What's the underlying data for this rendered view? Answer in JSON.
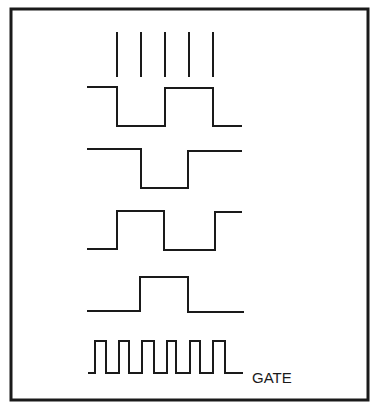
{
  "diagram": {
    "type": "timing-diagram",
    "frame": {
      "x": 11,
      "y": 9,
      "width": 357,
      "height": 391,
      "color": "#1a1a1a"
    },
    "clock_ticks": {
      "x": [
        117,
        141,
        165,
        189,
        213
      ],
      "y_top": 32,
      "y_bottom": 77
    },
    "waveforms": [
      {
        "name": "waveform-1",
        "points": "88,87 117,87 117,126 165,126 165,88 213,88 213,126 241,126"
      },
      {
        "name": "waveform-2",
        "points": "88,149 141,149 141,188 188,188 188,151 241,151"
      },
      {
        "name": "waveform-3",
        "points": "88,249 117,249 117,211 164,211 164,250 215,250 215,212 241,212"
      },
      {
        "name": "waveform-4",
        "points": "88,311 140,311 140,277 188,277 188,312 243,312"
      },
      {
        "name": "gate-waveform",
        "points": "89,373 95,373 95,341 106,341 106,373 119,373 119,341 129,341 129,373 142,373 142,341 154,341 154,373 167,373 167,341 176,341 176,373 190,373 190,341 200,341 200,373 213,373 213,341 225,341 225,373 242,373"
      }
    ],
    "labels": {
      "gate": "GATE"
    },
    "gate_label_pos": {
      "x": 252,
      "y": 383
    }
  }
}
